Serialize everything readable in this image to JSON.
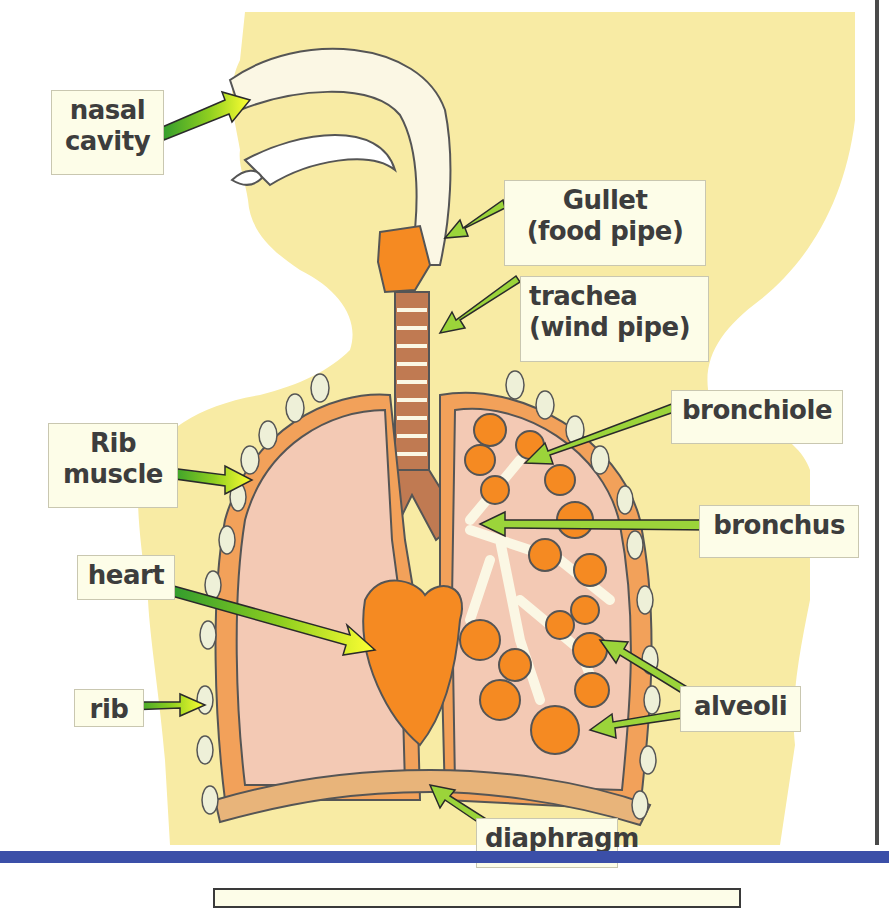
{
  "diagram": {
    "colors": {
      "body": "#f8eba4",
      "lung": "#f3c9b4",
      "pleura": "#f2a15a",
      "alveoli": "#f58a22",
      "airway": "#fbf7e4",
      "trachea_ring": "#c07a52",
      "arrow_green": "#2e9a2e",
      "arrow_yellow": "#ffff33",
      "rule": "#4a4a4a",
      "bar_blue": "#3b4fa8",
      "label_bg": "#fdfde8"
    },
    "labels": {
      "nasal_cavity": [
        "nasal",
        "cavity"
      ],
      "gullet": [
        "Gullet",
        "(food pipe)"
      ],
      "trachea": [
        "trachea",
        "(wind pipe)"
      ],
      "bronchiole": "bronchiole",
      "rib_muscle": [
        "Rib",
        "muscle"
      ],
      "bronchus": "bronchus",
      "heart": "heart",
      "rib": "rib",
      "alveoli": "alveoli",
      "diaphragm": "diaphragm"
    }
  }
}
